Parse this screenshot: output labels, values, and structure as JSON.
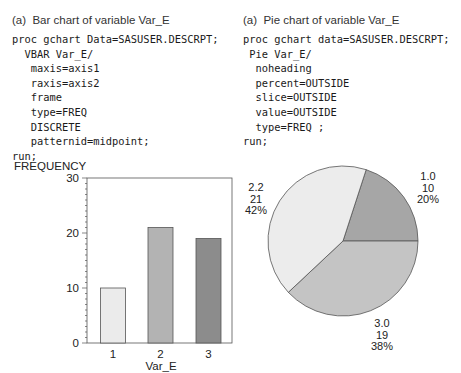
{
  "left_panel": {
    "caption": "(a)  Bar chart of variable Var_E",
    "code_lines": [
      "proc gchart Data=SASUSER.DESCRPT;",
      "  VBAR Var_E/",
      "   maxis=axis1",
      "   raxis=axis2",
      "   frame",
      "   type=FREQ",
      "   DISCRETE",
      "   patternid=midpoint;",
      "run;"
    ]
  },
  "right_panel": {
    "caption": "(a)  Pie chart of variable Var_E",
    "code_lines": [
      "proc gchart data=SASUSER.DESCRPT;",
      " Pie Var_E/",
      "  noheading",
      "  percent=OUTSIDE",
      "  slice=OUTSIDE",
      "  value=OUTSIDE",
      "  type=FREQ ;",
      "run;"
    ]
  },
  "chart_data": [
    {
      "type": "bar",
      "title": "Bar chart of variable Var_E",
      "xlabel": "Var_E",
      "ylabel": "FREQUENCY",
      "categories": [
        "1",
        "2",
        "3"
      ],
      "values": [
        10,
        21,
        19
      ],
      "ylim": [
        0,
        30
      ],
      "yticks": [
        "0",
        "10",
        "20",
        "30"
      ],
      "bar_colors": [
        "#ebebeb",
        "#b3b3b3",
        "#8c8c8c"
      ],
      "frame": true,
      "grid": false
    },
    {
      "type": "pie",
      "title": "Pie chart of variable Var_E",
      "slices": [
        {
          "label": "1.0",
          "value": 10,
          "percent": "20%",
          "color": "#a6a6a6"
        },
        {
          "label": "3.0",
          "value": 19,
          "percent": "38%",
          "color": "#c4c4c4"
        },
        {
          "label": "2.2",
          "value": 21,
          "percent": "42%",
          "color": "#ececec"
        }
      ]
    }
  ]
}
